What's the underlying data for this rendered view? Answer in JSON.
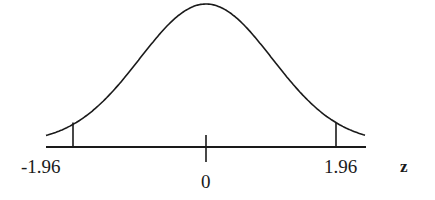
{
  "chart_data": {
    "type": "line",
    "title": "",
    "subtitle": "Standard normal distribution with critical values",
    "xlabel": "z",
    "ylabel": "",
    "x_ticks": [
      -1.96,
      0,
      1.96
    ],
    "tick_labels": [
      "-1.96",
      "0",
      "1.96"
    ],
    "xlim": [
      -3.0,
      3.0
    ],
    "ylim": [
      0,
      0.4
    ],
    "grid": false,
    "legend": null,
    "series": [
      {
        "name": "standard normal density",
        "x": [
          -3.0,
          -2.5,
          -1.96,
          -1.5,
          -1.0,
          -0.5,
          0,
          0.5,
          1.0,
          1.5,
          1.96,
          2.5,
          3.0
        ],
        "values": [
          0.0044,
          0.0175,
          0.0584,
          0.1295,
          0.242,
          0.3521,
          0.3989,
          0.3521,
          0.242,
          0.1295,
          0.0584,
          0.0175,
          0.0044
        ]
      }
    ],
    "annotations": [
      {
        "type": "vertical-tick",
        "x": -1.96,
        "label": "-1.96"
      },
      {
        "type": "vertical-tick",
        "x": 0,
        "label": "0"
      },
      {
        "type": "vertical-tick",
        "x": 1.96,
        "label": "1.96"
      }
    ]
  },
  "labels": {
    "left_critical": "-1.96",
    "center": "0",
    "right_critical": "1.96",
    "axis_variable": "z"
  },
  "colors": {
    "line": "#1a1a1a",
    "background": "#ffffff"
  }
}
